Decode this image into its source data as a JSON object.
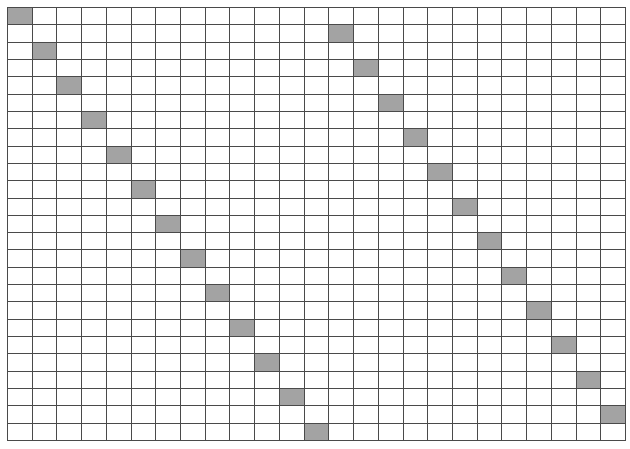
{
  "grid": {
    "rows": 25,
    "cols": 25,
    "fill_color": "#a3a3a3",
    "line_color": "#4a4a4a",
    "background_color": "#ffffff",
    "filled_cells": [
      {
        "row": 0,
        "col": 0
      },
      {
        "row": 2,
        "col": 1
      },
      {
        "row": 4,
        "col": 2
      },
      {
        "row": 6,
        "col": 3
      },
      {
        "row": 8,
        "col": 4
      },
      {
        "row": 10,
        "col": 5
      },
      {
        "row": 12,
        "col": 6
      },
      {
        "row": 14,
        "col": 7
      },
      {
        "row": 16,
        "col": 8
      },
      {
        "row": 18,
        "col": 9
      },
      {
        "row": 20,
        "col": 10
      },
      {
        "row": 22,
        "col": 11
      },
      {
        "row": 24,
        "col": 12
      },
      {
        "row": 1,
        "col": 13
      },
      {
        "row": 3,
        "col": 14
      },
      {
        "row": 5,
        "col": 15
      },
      {
        "row": 7,
        "col": 16
      },
      {
        "row": 9,
        "col": 17
      },
      {
        "row": 11,
        "col": 18
      },
      {
        "row": 13,
        "col": 19
      },
      {
        "row": 15,
        "col": 20
      },
      {
        "row": 17,
        "col": 21
      },
      {
        "row": 19,
        "col": 22
      },
      {
        "row": 21,
        "col": 23
      },
      {
        "row": 23,
        "col": 24
      }
    ]
  }
}
